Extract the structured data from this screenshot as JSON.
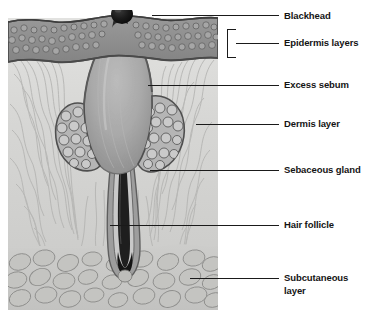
{
  "figure": {
    "background_color": "#ffffff",
    "label_color": "#141414",
    "leader_color": "#1a1a1a"
  },
  "illustration": {
    "region": {
      "x": 8,
      "y": 10,
      "width": 210,
      "height": 300
    },
    "palette": {
      "epidermis_fill": "#8e8e8e",
      "epidermis_outline": "#4a4a4a",
      "epidermis_cell": "#a8a8a8",
      "dermis_fill": "#d8d8d6",
      "dermis_fiber": "#b0b0ae",
      "sebum_fill": "#a5a5a5",
      "sebum_highlight": "#bdbdbd",
      "gland_fill": "#b9b9b9",
      "gland_outline": "#555555",
      "gland_cell": "#c9c9c9",
      "follicle_sheath": "#7c7c7c",
      "hair_shaft": "#232323",
      "blackhead_fill": "#131313",
      "subcutaneous_fill": "#cacac8",
      "adipocyte_fill": "#bdbdba",
      "adipocyte_outline": "#8c8c8a"
    },
    "structures": [
      {
        "name": "blackhead-plug",
        "description": "dark keratin plug at skin surface"
      },
      {
        "name": "epidermis-band",
        "description": "textured cellular surface layer"
      },
      {
        "name": "sebum-cavity",
        "description": "dilated follicle filled with excess sebum"
      },
      {
        "name": "dermis-field",
        "description": "wavy collagen fiber layer"
      },
      {
        "name": "sebaceous-gland-left",
        "description": "lobed gland of rounded cells"
      },
      {
        "name": "sebaceous-gland-right",
        "description": "lobed gland of rounded cells"
      },
      {
        "name": "hair-follicle-bulb",
        "description": "hair shaft and root sheath"
      },
      {
        "name": "subcutaneous-field",
        "description": "fat cell layer"
      }
    ]
  },
  "callouts": [
    {
      "id": "blackhead",
      "label": "Blackhead",
      "text_x": 284,
      "text_y": 10,
      "leader": {
        "x1": 152,
        "y1": 15,
        "x2": 279,
        "y2": 15
      },
      "bracket": false
    },
    {
      "id": "epidermis-layers",
      "label": "Epidermis layers",
      "text_x": 284,
      "text_y": 37,
      "leader": {
        "x1": 236,
        "y1": 43,
        "x2": 279,
        "y2": 43
      },
      "bracket": true,
      "bracket_rect": {
        "x": 227,
        "y": 29,
        "width": 9,
        "height": 28
      }
    },
    {
      "id": "excess-sebum",
      "label": "Excess sebum",
      "text_x": 284,
      "text_y": 79,
      "leader": {
        "x1": 148,
        "y1": 85,
        "x2": 279,
        "y2": 85
      },
      "bracket": false
    },
    {
      "id": "dermis-layer",
      "label": "Dermis layer",
      "text_x": 284,
      "text_y": 118,
      "leader": {
        "x1": 196,
        "y1": 124,
        "x2": 279,
        "y2": 124
      },
      "bracket": false
    },
    {
      "id": "sebaceous-gland",
      "label": "Sebaceous gland",
      "text_x": 284,
      "text_y": 164,
      "leader": {
        "x1": 150,
        "y1": 170,
        "x2": 279,
        "y2": 170
      },
      "bracket": false
    },
    {
      "id": "hair-follicle",
      "label": "Hair follicle",
      "text_x": 284,
      "text_y": 219,
      "leader": {
        "x1": 110,
        "y1": 225,
        "x2": 279,
        "y2": 225
      },
      "bracket": false
    },
    {
      "id": "subcutaneous-layer",
      "label": "Subcutaneous\nlayer",
      "text_x": 284,
      "text_y": 272,
      "leader": {
        "x1": 190,
        "y1": 278,
        "x2": 279,
        "y2": 278
      },
      "bracket": false
    }
  ]
}
